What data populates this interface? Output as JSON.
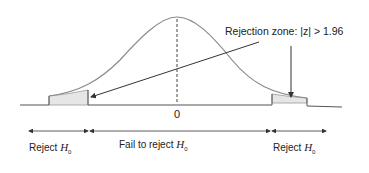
{
  "diagram": {
    "annotation": "Rejection zone: |z| > 1.96",
    "center_label": "0",
    "regions": [
      {
        "label": "Reject",
        "symbol": "H",
        "subscript": "0"
      },
      {
        "label": "Fail to reject",
        "symbol": "H",
        "subscript": "0"
      },
      {
        "label": "Reject",
        "symbol": "H",
        "subscript": "0"
      }
    ],
    "colors": {
      "curve": "#8a8a8a",
      "axis": "#444444",
      "shade": "#e6e6e6",
      "arrow": "#333333"
    }
  }
}
